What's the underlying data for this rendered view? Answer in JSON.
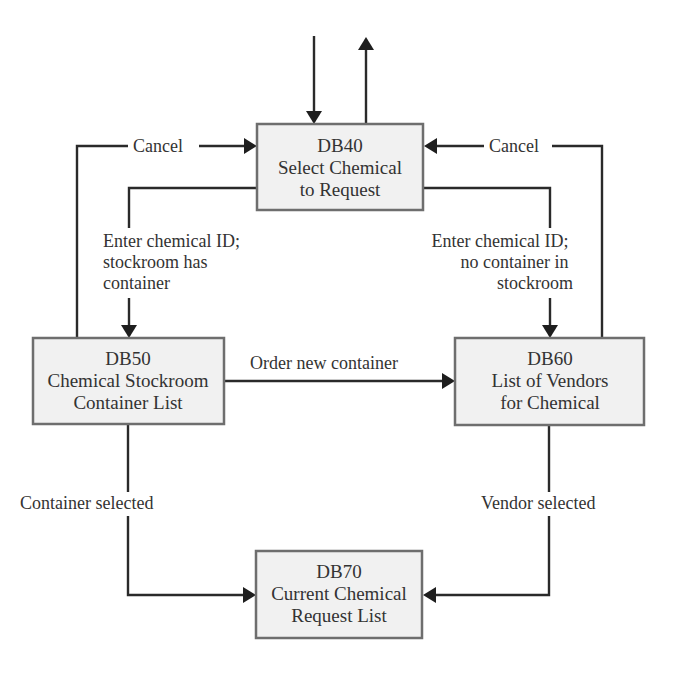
{
  "diagram": {
    "type": "screen-flow",
    "colors": {
      "box_fill": "#f1f1f1",
      "box_border": "#6e6e6e",
      "line": "#2a2a2a",
      "text": "#333333"
    },
    "nodes": {
      "db40": {
        "id": "DB40",
        "line1": "Select Chemical",
        "line2": "to Request"
      },
      "db50": {
        "id": "DB50",
        "line1": "Chemical Stockroom",
        "line2": "Container List"
      },
      "db60": {
        "id": "DB60",
        "line1": "List of Vendors",
        "line2": "for Chemical"
      },
      "db70": {
        "id": "DB70",
        "line1": "Current Chemical",
        "line2": "Request List"
      }
    },
    "edges": {
      "cancel_left": "Cancel",
      "cancel_right": "Cancel",
      "to_db50": {
        "line1": "Enter chemical ID;",
        "line2": "stockroom has",
        "line3": "container"
      },
      "to_db60": {
        "line1": "Enter chemical ID;",
        "line2": "no container in",
        "line3": "stockroom"
      },
      "order_new": "Order new container",
      "container_selected": "Container selected",
      "vendor_selected": "Vendor selected"
    }
  }
}
